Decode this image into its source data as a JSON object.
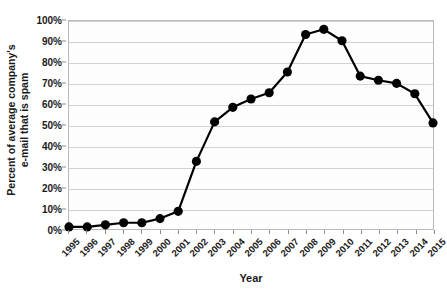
{
  "chart_data": {
    "type": "line",
    "title": "",
    "xlabel": "Year",
    "ylabel": "Percent of average company's e-mail that is spam",
    "ylabel_line1": "Percent of average company's",
    "ylabel_line2": "e-mail that is spam",
    "categories": [
      "1995",
      "1996",
      "1997",
      "1998",
      "1999",
      "2000",
      "2001",
      "2002",
      "2003",
      "2004",
      "2005",
      "2006",
      "2007",
      "2008",
      "2009",
      "2010",
      "2011",
      "2012",
      "2013",
      "2014",
      "2015"
    ],
    "values": [
      1,
      1,
      2,
      3,
      3,
      5,
      8.5,
      32.5,
      51.5,
      58.5,
      62.5,
      65.5,
      75.5,
      93.5,
      96,
      90.5,
      73.5,
      71.5,
      70,
      65,
      51
    ],
    "ylim": [
      0,
      100
    ],
    "ytick_labels": [
      "0%",
      "10%",
      "20%",
      "30%",
      "40%",
      "50%",
      "60%",
      "70%",
      "80%",
      "90%",
      "100%"
    ],
    "ytick_values": [
      0,
      10,
      20,
      30,
      40,
      50,
      60,
      70,
      80,
      90,
      100
    ],
    "grid": true,
    "legend": false,
    "legend_position": "none",
    "series_color": "#000000",
    "gridline_color": "#d2d2d2",
    "plot_border_color": "#b9b9b9",
    "plot_background": "#fdfdfd",
    "marker": "circle",
    "marker_size": 4.6,
    "line_width": 2.2
  }
}
